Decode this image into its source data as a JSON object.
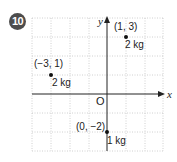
{
  "problem": {
    "number": "10"
  },
  "diagram": {
    "type": "coordinate-plane",
    "axis_labels": {
      "x": "x",
      "y": "y"
    },
    "origin_label": "O",
    "grid": {
      "x_range": [
        -4,
        3
      ],
      "y_range": [
        -3,
        4
      ],
      "step": 1,
      "style": "dotted"
    },
    "points": [
      {
        "coord_label": "(1, 3)",
        "x": 1,
        "y": 3,
        "mass_label": "2 kg"
      },
      {
        "coord_label": "(−3, 1)",
        "x": -3,
        "y": 1,
        "mass_label": "2 kg"
      },
      {
        "coord_label": "(0, −2)",
        "x": 0,
        "y": -2,
        "mass_label": "1 kg"
      }
    ],
    "colors": {
      "badge": "#4d4d4d",
      "grid": "#bdbdbd",
      "axes": "#222222"
    }
  }
}
